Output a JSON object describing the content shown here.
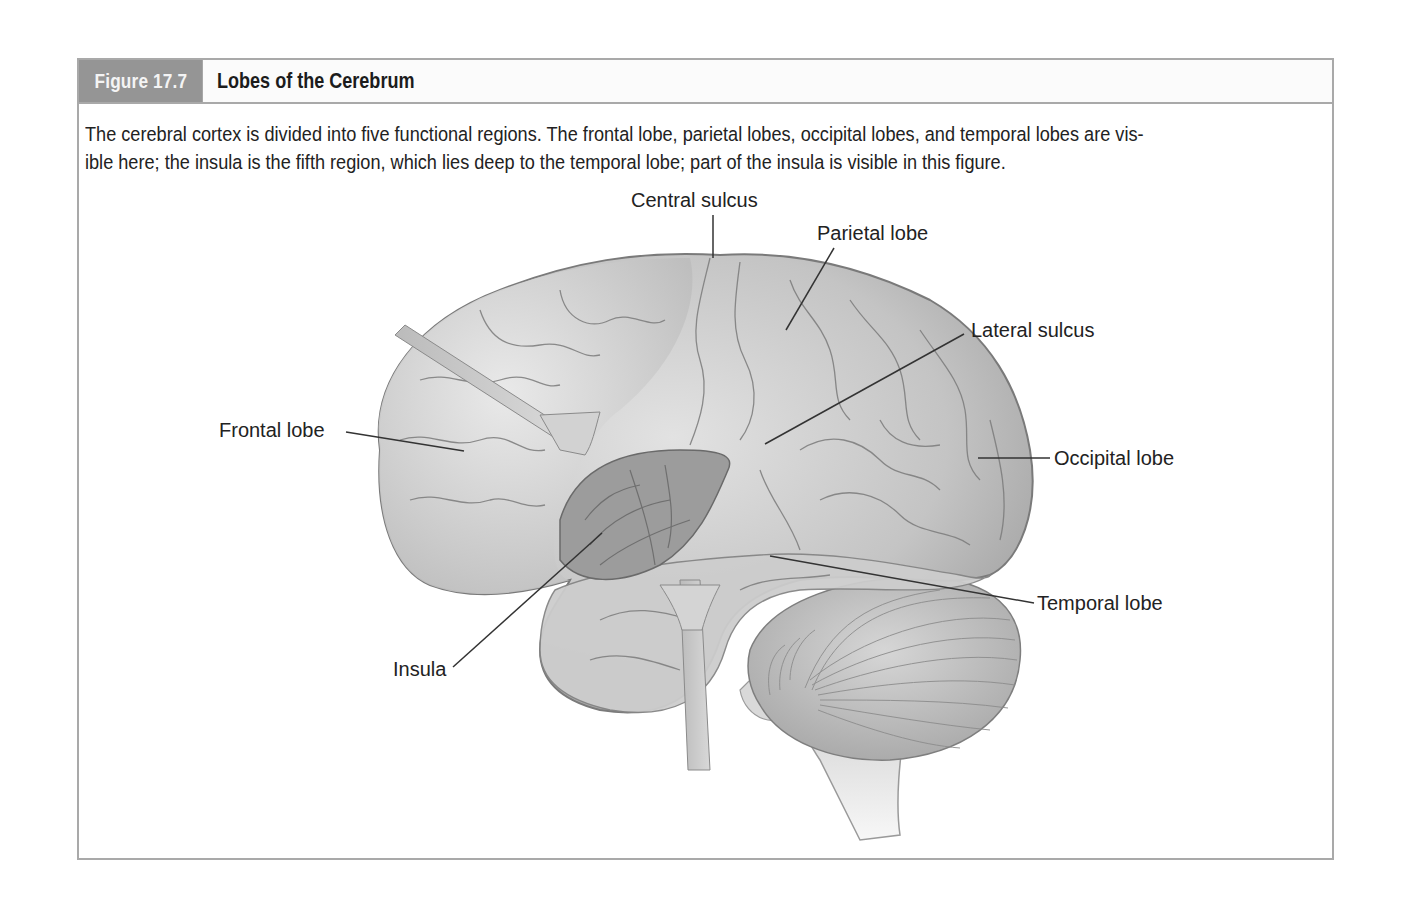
{
  "figure": {
    "number": "Figure 17.7",
    "title": "Lobes of the Cerebrum",
    "caption_line1": "The cerebral cortex is divided into five functional regions. The frontal lobe, parietal lobes, occipital lobes, and temporal lobes are vis-",
    "caption_line2": "ible here; the insula is the fifth region, which lies deep to the temporal lobe; part of the insula is visible in this figure."
  },
  "illustration": {
    "subject": "lateral view of human brain with retractors exposing insula",
    "labels": {
      "central_sulcus": "Central sulcus",
      "parietal_lobe": "Parietal lobe",
      "lateral_sulcus": "Lateral sulcus",
      "frontal_lobe": "Frontal lobe",
      "occipital_lobe": "Occipital lobe",
      "temporal_lobe": "Temporal lobe",
      "insula": "Insula"
    }
  },
  "colors": {
    "header_tab": "#959595",
    "border": "#a9a9a9",
    "brain_fill": "#c9c9c9",
    "brain_dark": "#8a8a8a"
  }
}
